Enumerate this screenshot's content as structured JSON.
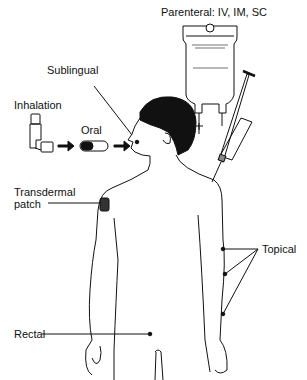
{
  "diagram": {
    "labels": {
      "parenteral": "Parenteral: IV, IM, SC",
      "sublingual": "Sublingual",
      "inhalation": "Inhalation",
      "oral": "Oral",
      "transdermal_line1": "Transdermal",
      "transdermal_line2": "patch",
      "topical": "Topical",
      "rectal": "Rectal"
    },
    "colors": {
      "line": "#111111",
      "hair": "#111111",
      "patch": "#333333",
      "background": "#ffffff"
    }
  }
}
